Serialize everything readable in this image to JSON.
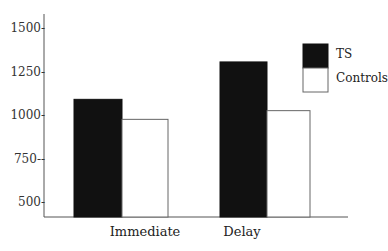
{
  "chart_data": {
    "type": "bar",
    "title": "",
    "xlabel": "",
    "ylabel": "",
    "categories": [
      "Immediate",
      "Delay"
    ],
    "series": [
      {
        "name": "TS",
        "color": "#111111",
        "values": [
          1090,
          1305
        ]
      },
      {
        "name": "Controls",
        "color": "#ffffff",
        "values": [
          975,
          1025
        ]
      }
    ],
    "yticks": [
      500,
      750,
      1000,
      1250,
      1500
    ],
    "ytick_labels": [
      "500-",
      "750--",
      "1000-",
      "1250-",
      "1500-"
    ],
    "ylim": [
      425,
      1575
    ],
    "grid": false,
    "legend_position": "upper right"
  }
}
